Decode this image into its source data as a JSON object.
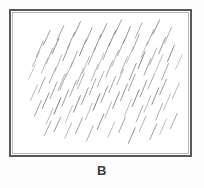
{
  "figure": {
    "panel_label": "B",
    "background_color": "#fdfdfd",
    "plot_background_color": "#ffffff",
    "frame_color": "#595959",
    "frame_inner_color": "#b9b9b9",
    "label_color": "#3b3b3b"
  },
  "chart_data": {
    "type": "scatter",
    "title": "B",
    "xlabel": "",
    "ylabel": "",
    "xlim": [
      0,
      183
    ],
    "ylim": [
      0,
      148
    ],
    "grid": false,
    "legend": null,
    "annotations": [
      "B"
    ],
    "marker_style": {
      "shape": "line-segment",
      "orientation_deg_from_horizontal": 72,
      "stroke_width": 0.9,
      "colors": [
        "#8c8c8c",
        "#9e9e9e",
        "#b0b0b0",
        "#6e6e6e",
        "#c0c0c0"
      ]
    },
    "series": [
      {
        "name": "hatch-strokes",
        "count": 96,
        "comment": "each stroke given as x1,y1,x2,y2 in frame pixel coords (origin top-left of plot area) plus gray level",
        "values": [
          [
            22,
            57,
            29,
            42,
            "#a8a8a8"
          ],
          [
            26,
            47,
            33,
            31,
            "#9a9a9a"
          ],
          [
            31,
            64,
            38,
            48,
            "#b2b2b2"
          ],
          [
            33,
            35,
            40,
            20,
            "#8f8f8f"
          ],
          [
            36,
            54,
            43,
            38,
            "#a0a0a0"
          ],
          [
            39,
            74,
            46,
            58,
            "#9c9c9c"
          ],
          [
            42,
            44,
            49,
            28,
            "#7f7f7f"
          ],
          [
            45,
            62,
            52,
            45,
            "#aeaeae"
          ],
          [
            47,
            30,
            54,
            15,
            "#969696"
          ],
          [
            50,
            81,
            57,
            64,
            "#a4a4a4"
          ],
          [
            53,
            51,
            60,
            34,
            "#8a8a8a"
          ],
          [
            56,
            68,
            63,
            52,
            "#b4b4b4"
          ],
          [
            58,
            38,
            65,
            22,
            "#909090"
          ],
          [
            61,
            58,
            68,
            41,
            "#9d9d9d"
          ],
          [
            64,
            26,
            71,
            11,
            "#888888"
          ],
          [
            67,
            76,
            74,
            59,
            "#a6a6a6"
          ],
          [
            70,
            46,
            77,
            29,
            "#7c7c7c"
          ],
          [
            73,
            64,
            80,
            47,
            "#b0b0b0"
          ],
          [
            76,
            33,
            83,
            17,
            "#949494"
          ],
          [
            79,
            55,
            86,
            38,
            "#9f9f9f"
          ],
          [
            82,
            72,
            89,
            55,
            "#a9a9a9"
          ],
          [
            85,
            41,
            92,
            24,
            "#868686"
          ],
          [
            88,
            60,
            95,
            43,
            "#b6b6b6"
          ],
          [
            91,
            28,
            98,
            13,
            "#8d8d8d"
          ],
          [
            94,
            50,
            101,
            33,
            "#9b9b9b"
          ],
          [
            97,
            68,
            104,
            51,
            "#a3a3a3"
          ],
          [
            100,
            36,
            107,
            20,
            "#7a7a7a"
          ],
          [
            103,
            57,
            110,
            40,
            "#aeaeae"
          ],
          [
            106,
            24,
            113,
            9,
            "#929292"
          ],
          [
            109,
            46,
            116,
            29,
            "#9e9e9e"
          ],
          [
            112,
            64,
            119,
            47,
            "#a7a7a7"
          ],
          [
            115,
            33,
            122,
            16,
            "#848484"
          ],
          [
            118,
            54,
            125,
            37,
            "#b3b3b3"
          ],
          [
            121,
            71,
            128,
            54,
            "#8b8b8b"
          ],
          [
            124,
            41,
            131,
            24,
            "#9c9c9c"
          ],
          [
            127,
            28,
            134,
            12,
            "#a5a5a5"
          ],
          [
            130,
            59,
            137,
            42,
            "#787878"
          ],
          [
            133,
            48,
            140,
            31,
            "#b1b1b1"
          ],
          [
            136,
            66,
            143,
            49,
            "#909090"
          ],
          [
            139,
            35,
            146,
            19,
            "#9d9d9d"
          ],
          [
            142,
            55,
            149,
            38,
            "#a8a8a8"
          ],
          [
            145,
            24,
            152,
            9,
            "#868686"
          ],
          [
            148,
            62,
            155,
            45,
            "#b5b5b5"
          ],
          [
            151,
            44,
            158,
            27,
            "#8e8e8e"
          ],
          [
            154,
            71,
            161,
            54,
            "#9a9a9a"
          ],
          [
            157,
            33,
            164,
            17,
            "#a4a4a4"
          ],
          [
            160,
            52,
            167,
            35,
            "#7d7d7d"
          ],
          [
            20,
            92,
            27,
            76,
            "#adadad"
          ],
          [
            24,
            108,
            31,
            92,
            "#939393"
          ],
          [
            28,
            84,
            35,
            68,
            "#a1a1a1"
          ],
          [
            32,
            100,
            39,
            84,
            "#888888"
          ],
          [
            36,
            116,
            43,
            100,
            "#b2b2b2"
          ],
          [
            40,
            90,
            47,
            73,
            "#999999"
          ],
          [
            44,
            106,
            51,
            89,
            "#6f6f6f"
          ],
          [
            48,
            82,
            55,
            65,
            "#aaaaaa"
          ],
          [
            52,
            98,
            59,
            81,
            "#909090"
          ],
          [
            56,
            114,
            63,
            97,
            "#b6b6b6"
          ],
          [
            60,
            88,
            67,
            71,
            "#9e9e9e"
          ],
          [
            64,
            104,
            71,
            87,
            "#7b7b7b"
          ],
          [
            68,
            80,
            75,
            64,
            "#a6a6a6"
          ],
          [
            72,
            96,
            79,
            79,
            "#8c8c8c"
          ],
          [
            76,
            112,
            83,
            95,
            "#b3b3b3"
          ],
          [
            80,
            86,
            87,
            69,
            "#9b9b9b"
          ],
          [
            84,
            102,
            91,
            85,
            "#767676"
          ],
          [
            88,
            78,
            95,
            62,
            "#a9a9a9"
          ],
          [
            92,
            94,
            99,
            77,
            "#8f8f8f"
          ],
          [
            96,
            110,
            103,
            93,
            "#b0b0b0"
          ],
          [
            100,
            84,
            107,
            67,
            "#9d9d9d"
          ],
          [
            104,
            100,
            111,
            83,
            "#828282"
          ],
          [
            108,
            76,
            115,
            60,
            "#a5a5a5"
          ],
          [
            112,
            92,
            119,
            75,
            "#8a8a8a"
          ],
          [
            116,
            108,
            123,
            91,
            "#b4b4b4"
          ],
          [
            120,
            82,
            127,
            65,
            "#989898"
          ],
          [
            124,
            98,
            131,
            81,
            "#797979"
          ],
          [
            128,
            114,
            135,
            97,
            "#a7a7a7"
          ],
          [
            132,
            88,
            139,
            71,
            "#919191"
          ],
          [
            136,
            104,
            143,
            87,
            "#b1b1b1"
          ],
          [
            140,
            80,
            147,
            64,
            "#9c9c9c"
          ],
          [
            144,
            96,
            151,
            79,
            "#858585"
          ],
          [
            148,
            112,
            155,
            95,
            "#a3a3a3"
          ],
          [
            152,
            86,
            159,
            70,
            "#8d8d8d"
          ],
          [
            156,
            102,
            163,
            85,
            "#b5b5b5"
          ],
          [
            34,
            128,
            41,
            113,
            "#a0a0a0"
          ],
          [
            44,
            124,
            51,
            109,
            "#8b8b8b"
          ],
          [
            55,
            131,
            62,
            115,
            "#aeaeae"
          ],
          [
            66,
            126,
            73,
            110,
            "#959595"
          ],
          [
            77,
            134,
            84,
            118,
            "#9f9f9f"
          ],
          [
            88,
            122,
            95,
            106,
            "#868686"
          ],
          [
            99,
            130,
            106,
            114,
            "#b2b2b2"
          ],
          [
            110,
            125,
            117,
            109,
            "#9a9a9a"
          ],
          [
            120,
            136,
            127,
            120,
            "#7e7e7e"
          ],
          [
            131,
            124,
            138,
            108,
            "#aaaaaa"
          ],
          [
            142,
            132,
            149,
            116,
            "#909090"
          ],
          [
            152,
            127,
            159,
            111,
            "#b6b6b6"
          ],
          [
            163,
            121,
            170,
            105,
            "#9d9d9d"
          ],
          [
            18,
            70,
            25,
            55,
            "#b8b8b8"
          ],
          [
            165,
            90,
            172,
            74,
            "#b0b0b0"
          ],
          [
            168,
            60,
            175,
            45,
            "#bcbcbc"
          ]
        ]
      }
    ]
  }
}
